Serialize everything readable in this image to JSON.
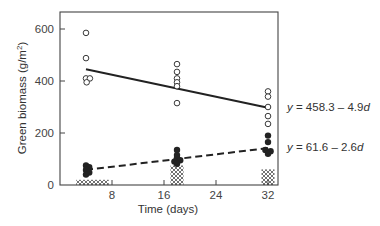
{
  "chart_data": {
    "type": "scatter",
    "title": "",
    "xlabel": "Time (days)",
    "ylabel": "Green biomass (g/m²)",
    "ylabel_main": "Green biomass (g/m",
    "ylabel_sup": "2",
    "ylabel_end": ")",
    "xlim": [
      0,
      33
    ],
    "ylim": [
      0,
      665
    ],
    "x_ticks": [
      8,
      16,
      24,
      32
    ],
    "x_tick_labels": [
      "8",
      "16",
      "24",
      "32"
    ],
    "y_ticks": [
      0,
      200,
      400,
      600
    ],
    "y_tick_labels": [
      "0",
      "200",
      "400",
      "600"
    ],
    "grid": false,
    "legend": null,
    "series": [
      {
        "name": "open circles",
        "marker": "open-circle",
        "points": [
          [
            4,
            585
          ],
          [
            4,
            488
          ],
          [
            4,
            410
          ],
          [
            4.6,
            410
          ],
          [
            4.1,
            395
          ],
          [
            18,
            465
          ],
          [
            18,
            435
          ],
          [
            18,
            410
          ],
          [
            18,
            395
          ],
          [
            18,
            380
          ],
          [
            18,
            315
          ],
          [
            32,
            360
          ],
          [
            32,
            340
          ],
          [
            32,
            300
          ],
          [
            32,
            265
          ],
          [
            32,
            235
          ]
        ]
      },
      {
        "name": "filled circles",
        "marker": "filled-circle",
        "points": [
          [
            4,
            75
          ],
          [
            4.5,
            68
          ],
          [
            4,
            58
          ],
          [
            4.5,
            48
          ],
          [
            4,
            40
          ],
          [
            18,
            135
          ],
          [
            18,
            115
          ],
          [
            18,
            105
          ],
          [
            18.5,
            95
          ],
          [
            17.6,
            90
          ],
          [
            18,
            82
          ],
          [
            32,
            190
          ],
          [
            32,
            165
          ],
          [
            31.6,
            135
          ],
          [
            32.4,
            130
          ],
          [
            32,
            120
          ]
        ]
      },
      {
        "name": "hatched (dead) biomass",
        "marker": "crosshatch",
        "bars": [
          {
            "x_from": 2.5,
            "x_to": 7.5,
            "y_from": 0,
            "y_to": 20
          },
          {
            "x_from": 17,
            "x_to": 19,
            "y_from": 0,
            "y_to": 75
          },
          {
            "x_from": 31,
            "x_to": 33,
            "y_from": 0,
            "y_to": 60
          }
        ]
      }
    ],
    "regressions": [
      {
        "name": "solid",
        "style": "solid",
        "label": "y = 458.3 – 4.9d",
        "x": [
          4,
          32
        ],
        "y": [
          445,
          297
        ]
      },
      {
        "name": "dashed",
        "style": "dashed",
        "label": "y = 61.6 – 2.6d",
        "x": [
          4,
          32
        ],
        "y": [
          58,
          142
        ]
      }
    ],
    "annotations": [
      {
        "text": "y = 458.3 – 4.9d",
        "position": "right of solid line end"
      },
      {
        "text": "y = 61.6 – 2.6d",
        "position": "right of dashed line end"
      }
    ]
  },
  "labels": {
    "eq1_y": "y",
    "eq1_mid": " = 458.3 – 4.9",
    "eq1_d": "d",
    "eq2_y": "y",
    "eq2_mid": " = 61.6 – 2.6",
    "eq2_d": "d"
  },
  "colors": {
    "ink": "#222222",
    "axis": "#444444",
    "background": "#ffffff"
  }
}
